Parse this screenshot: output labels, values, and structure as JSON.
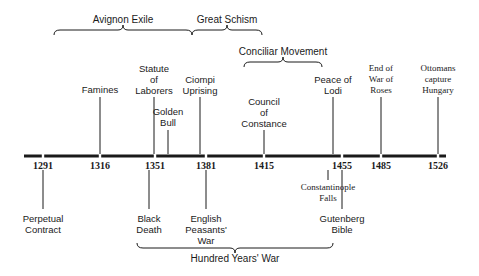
{
  "timeline": {
    "axis": {
      "y": 156,
      "x_start": 24,
      "x_end": 446,
      "color": "#1a1a1a"
    },
    "years": [
      {
        "label": "1291",
        "x": 43
      },
      {
        "label": "1316",
        "x": 100
      },
      {
        "label": "1351",
        "x": 155
      },
      {
        "label": "1381",
        "x": 206
      },
      {
        "label": "1415",
        "x": 264
      },
      {
        "label": "1455",
        "x": 342
      },
      {
        "label": "1485",
        "x": 381
      },
      {
        "label": "1526",
        "x": 438
      }
    ],
    "events_above": [
      {
        "label": "Famines",
        "x": 100,
        "text_top": 84,
        "line_top": 97
      },
      {
        "label": "Statute\nof\nLaborers",
        "x": 154,
        "text_top": 63,
        "line_top": 97
      },
      {
        "label": "Golden\nBull",
        "x": 168,
        "text_top": 106,
        "line_top": 130
      },
      {
        "label": "Ciompi\nUprising",
        "x": 200,
        "text_top": 74,
        "line_top": 97
      },
      {
        "label": "Council\nof\nConstance",
        "x": 264,
        "text_top": 96,
        "line_top": 130
      },
      {
        "label": "Peace of\nLodi",
        "x": 333,
        "text_top": 74,
        "line_top": 97
      },
      {
        "label": "End of\nWar of\nRoses",
        "x": 381,
        "text_top": 63,
        "line_top": 97,
        "serif": true
      },
      {
        "label": "Ottomans\ncapture\nHungary",
        "x": 438,
        "text_top": 63,
        "line_top": 97,
        "serif": true
      }
    ],
    "events_below": [
      {
        "label": "Perpetual\nContract",
        "x": 43,
        "line_bottom": 209,
        "text_top": 213
      },
      {
        "label": "Black\nDeath",
        "x": 149,
        "line_bottom": 209,
        "text_top": 213
      },
      {
        "label": "English\nPeasants'\nWar",
        "x": 206,
        "line_bottom": 209,
        "text_top": 213
      },
      {
        "label": "Constantinople\nFalls",
        "x": 328,
        "line_bottom": 180,
        "text_top": 182,
        "serif": true
      },
      {
        "label": "Gutenberg\nBible",
        "x": 342,
        "line_bottom": 209,
        "text_top": 213
      }
    ],
    "periods": [
      {
        "label": "Avignon Exile",
        "x1": 54,
        "x2": 192,
        "y": 30,
        "dir": "up",
        "label_x": 123,
        "label_top": 14
      },
      {
        "label": "Great Schism",
        "x1": 192,
        "x2": 262,
        "y": 30,
        "dir": "up",
        "label_x": 227,
        "label_top": 14
      },
      {
        "label": "Conciliar Movement",
        "x1": 244,
        "x2": 322,
        "y": 62,
        "dir": "up",
        "label_x": 283,
        "label_top": 46
      },
      {
        "label": "Hundred Years' War",
        "x1": 137,
        "x2": 333,
        "y": 248,
        "dir": "down",
        "label_x": 235,
        "label_top": 253
      }
    ]
  }
}
